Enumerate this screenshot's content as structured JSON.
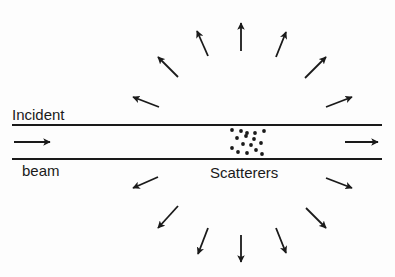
{
  "diagram": {
    "labels": {
      "incident": "Incident",
      "beam": "beam",
      "scatterers": "Scatterers"
    },
    "colors": {
      "ink": "#1a1a1a",
      "background": "#fdfdfd"
    },
    "beam": {
      "top_line": {
        "x1": 12,
        "x2": 382,
        "y": 125
      },
      "bottom_line": {
        "x1": 12,
        "x2": 382,
        "y": 159
      },
      "incoming_arrow": {
        "x1": 14,
        "y1": 142,
        "x2": 50,
        "y2": 142
      },
      "outgoing_arrow": {
        "x1": 345,
        "y1": 142,
        "x2": 378,
        "y2": 142
      }
    },
    "scatterer_dots": [
      [
        232,
        130
      ],
      [
        241,
        131
      ],
      [
        247,
        133
      ],
      [
        255,
        133
      ],
      [
        264,
        131
      ],
      [
        237,
        138
      ],
      [
        246,
        136
      ],
      [
        254,
        139
      ],
      [
        243,
        144
      ],
      [
        251,
        145
      ],
      [
        261,
        143
      ],
      [
        232,
        148
      ],
      [
        238,
        152
      ],
      [
        247,
        153
      ],
      [
        256,
        150
      ],
      [
        262,
        154
      ]
    ],
    "scattered_arrows": [
      {
        "dir": "upper-left",
        "x1": 159,
        "y1": 107,
        "x2": 133,
        "y2": 97
      },
      {
        "dir": "up-left",
        "x1": 178,
        "y1": 77,
        "x2": 158,
        "y2": 57
      },
      {
        "dir": "up-slight-left",
        "x1": 208,
        "y1": 56,
        "x2": 197,
        "y2": 31
      },
      {
        "dir": "up",
        "x1": 241,
        "y1": 51,
        "x2": 241,
        "y2": 23
      },
      {
        "dir": "up-slight-right",
        "x1": 276,
        "y1": 57,
        "x2": 286,
        "y2": 32
      },
      {
        "dir": "up-right",
        "x1": 305,
        "y1": 78,
        "x2": 326,
        "y2": 57
      },
      {
        "dir": "upper-right",
        "x1": 326,
        "y1": 107,
        "x2": 352,
        "y2": 97
      },
      {
        "dir": "lower-left",
        "x1": 158,
        "y1": 177,
        "x2": 133,
        "y2": 188
      },
      {
        "dir": "down-left",
        "x1": 178,
        "y1": 206,
        "x2": 158,
        "y2": 228
      },
      {
        "dir": "down-slight-left",
        "x1": 208,
        "y1": 228,
        "x2": 198,
        "y2": 254
      },
      {
        "dir": "down",
        "x1": 241,
        "y1": 235,
        "x2": 241,
        "y2": 262
      },
      {
        "dir": "down-slight-right",
        "x1": 276,
        "y1": 228,
        "x2": 286,
        "y2": 253
      },
      {
        "dir": "down-right",
        "x1": 306,
        "y1": 208,
        "x2": 326,
        "y2": 228
      },
      {
        "dir": "lower-right",
        "x1": 326,
        "y1": 178,
        "x2": 352,
        "y2": 188
      }
    ]
  }
}
